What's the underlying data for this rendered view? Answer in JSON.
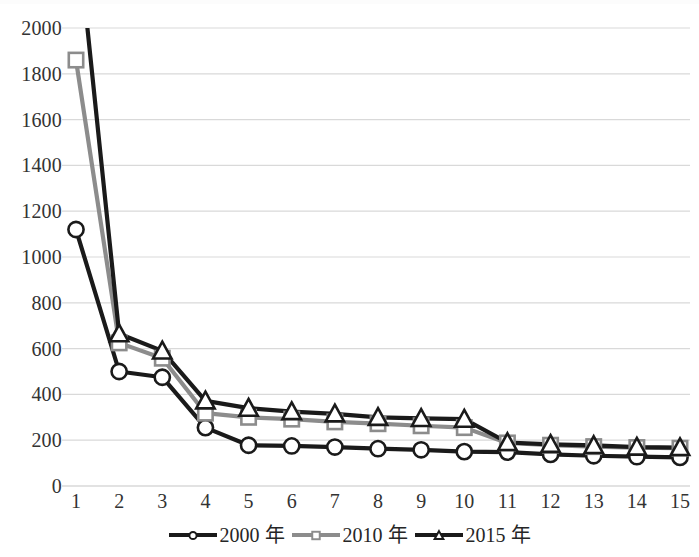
{
  "chart_data": {
    "type": "line",
    "title": "",
    "subtitle": "",
    "xlabel": "",
    "ylabel": "",
    "x": [
      1,
      2,
      3,
      4,
      5,
      6,
      7,
      8,
      9,
      10,
      11,
      12,
      13,
      14,
      15
    ],
    "categories": [
      "1",
      "2",
      "3",
      "4",
      "5",
      "6",
      "7",
      "8",
      "9",
      "10",
      "11",
      "12",
      "13",
      "14",
      "15"
    ],
    "series": [
      {
        "name": "2000 年",
        "marker": "circle",
        "color": "#1a1a1a",
        "values": [
          1120,
          500,
          475,
          255,
          178,
          175,
          170,
          163,
          158,
          150,
          148,
          138,
          132,
          128,
          125
        ]
      },
      {
        "name": "2010 年",
        "marker": "square",
        "color": "#8c8c8c",
        "values": [
          1860,
          625,
          558,
          318,
          300,
          292,
          280,
          272,
          263,
          255,
          188,
          178,
          172,
          168,
          165
        ]
      },
      {
        "name": "2015 年",
        "marker": "triangle",
        "color": "#1a1a1a",
        "values": [
          2480,
          665,
          590,
          372,
          340,
          325,
          315,
          300,
          295,
          292,
          190,
          182,
          177,
          170,
          168
        ]
      }
    ],
    "xlim": [
      1,
      15
    ],
    "ylim": [
      0,
      2000
    ],
    "y_ticks": [
      0,
      200,
      400,
      600,
      800,
      1000,
      1200,
      1400,
      1600,
      1800,
      2000
    ],
    "y_tick_labels": [
      "0",
      "200",
      "400",
      "600",
      "800",
      "1000",
      "1200",
      "1400",
      "1600",
      "1800",
      "2000"
    ],
    "grid": "horizontal",
    "grid_color": "#d9d9d9",
    "legend_position": "bottom",
    "legend": [
      "2000 年",
      "2010 年",
      "2015 年"
    ],
    "clipped_note": "2015 series value at x=1 exceeds the top of the axis"
  },
  "axes": {
    "y_ticks": [
      "2000",
      "1800",
      "1600",
      "1400",
      "1200",
      "1000",
      "800",
      "600",
      "400",
      "200",
      "0"
    ],
    "x_ticks": [
      "1",
      "2",
      "3",
      "4",
      "5",
      "6",
      "7",
      "8",
      "9",
      "10",
      "11",
      "12",
      "13",
      "14",
      "15"
    ]
  },
  "legend": {
    "items": [
      {
        "label": "2000 年",
        "marker": "circle-marker",
        "color": "#1a1a1a"
      },
      {
        "label": "2010 年",
        "marker": "square-marker",
        "color": "#8c8c8c"
      },
      {
        "label": "2015 年",
        "marker": "triangle-marker",
        "color": "#1a1a1a"
      }
    ]
  }
}
